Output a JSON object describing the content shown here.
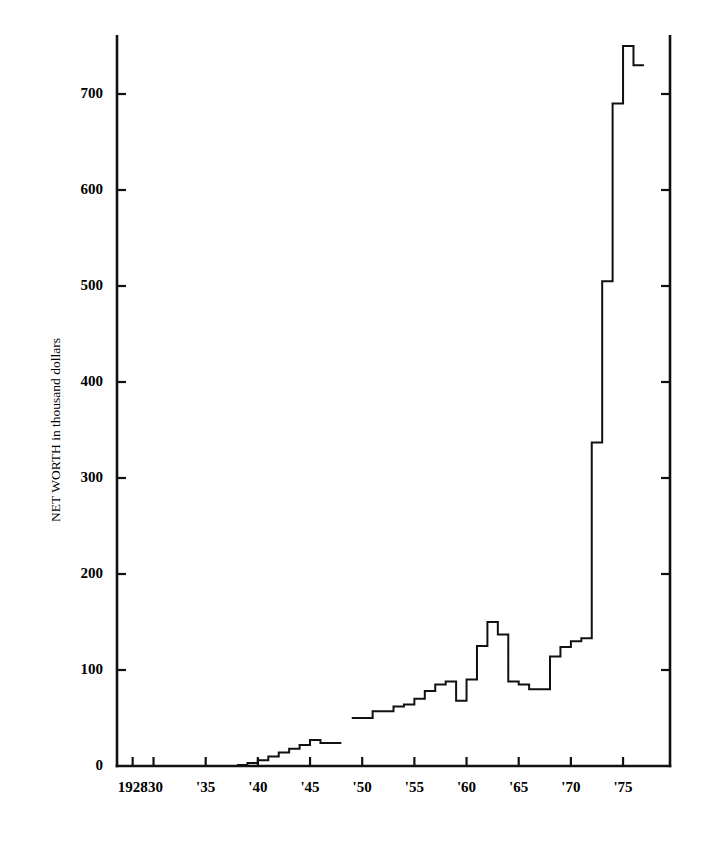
{
  "chart_data": {
    "type": "line",
    "title": "",
    "subtitle": "",
    "xlabel": "",
    "ylabel": "NET WORTH in thousand dollars",
    "ylim": [
      0,
      760
    ],
    "xlim": [
      1926.5,
      1979.5
    ],
    "grid": false,
    "legend": null,
    "annotations": [],
    "style": "step-post",
    "line_color": "#111111",
    "background_color": "#ffffff",
    "y_ticks": [
      0,
      100,
      200,
      300,
      400,
      500,
      600,
      700
    ],
    "y_tick_labels": [
      "0",
      "100",
      "200",
      "300",
      "400",
      "500",
      "600",
      "700"
    ],
    "x_ticks": [
      1928,
      1930,
      1935,
      1940,
      1945,
      1950,
      1955,
      1960,
      1965,
      1970,
      1975
    ],
    "x_tick_labels": [
      "1928",
      "'30",
      "'35",
      "'40",
      "'45",
      "'50",
      "'55",
      "'60",
      "'65",
      "'70",
      "'75"
    ],
    "x_minor_ticks": [
      1928,
      1930,
      1935,
      1940,
      1945,
      1950,
      1955,
      1960,
      1965,
      1970,
      1975
    ],
    "axis_spines": [
      "left",
      "bottom",
      "right"
    ],
    "segments": [
      {
        "name": "early-period",
        "x": [
          1938,
          1939,
          1940,
          1941,
          1942,
          1943,
          1944,
          1945,
          1946,
          1947
        ],
        "y": [
          1,
          3,
          6,
          10,
          14,
          18,
          22,
          27,
          24,
          24
        ]
      },
      {
        "name": "late-period",
        "x": [
          1949,
          1950,
          1951,
          1952,
          1953,
          1954,
          1955,
          1956,
          1957,
          1958,
          1959,
          1960,
          1961,
          1962,
          1963,
          1964,
          1965,
          1966,
          1967,
          1968,
          1969,
          1970,
          1971,
          1972,
          1973,
          1974,
          1975,
          1976
        ],
        "y": [
          50,
          50,
          57,
          57,
          62,
          64,
          70,
          78,
          85,
          88,
          68,
          90,
          125,
          150,
          137,
          88,
          85,
          80,
          80,
          114,
          124,
          130,
          133,
          337,
          505,
          690,
          750,
          730
        ]
      }
    ],
    "series": [
      {
        "name": "Net worth",
        "points": [
          {
            "year": 1938,
            "value": 1
          },
          {
            "year": 1939,
            "value": 3
          },
          {
            "year": 1940,
            "value": 6
          },
          {
            "year": 1941,
            "value": 10
          },
          {
            "year": 1942,
            "value": 14
          },
          {
            "year": 1943,
            "value": 18
          },
          {
            "year": 1944,
            "value": 22
          },
          {
            "year": 1945,
            "value": 27
          },
          {
            "year": 1946,
            "value": 24
          },
          {
            "year": 1947,
            "value": 24
          },
          {
            "year": 1949,
            "value": 50
          },
          {
            "year": 1950,
            "value": 50
          },
          {
            "year": 1951,
            "value": 57
          },
          {
            "year": 1952,
            "value": 57
          },
          {
            "year": 1953,
            "value": 62
          },
          {
            "year": 1954,
            "value": 64
          },
          {
            "year": 1955,
            "value": 70
          },
          {
            "year": 1956,
            "value": 78
          },
          {
            "year": 1957,
            "value": 85
          },
          {
            "year": 1958,
            "value": 88
          },
          {
            "year": 1959,
            "value": 68
          },
          {
            "year": 1960,
            "value": 90
          },
          {
            "year": 1961,
            "value": 125
          },
          {
            "year": 1962,
            "value": 150
          },
          {
            "year": 1963,
            "value": 137
          },
          {
            "year": 1964,
            "value": 88
          },
          {
            "year": 1965,
            "value": 85
          },
          {
            "year": 1966,
            "value": 80
          },
          {
            "year": 1967,
            "value": 80
          },
          {
            "year": 1968,
            "value": 114
          },
          {
            "year": 1969,
            "value": 124
          },
          {
            "year": 1970,
            "value": 130
          },
          {
            "year": 1971,
            "value": 133
          },
          {
            "year": 1972,
            "value": 337
          },
          {
            "year": 1973,
            "value": 505
          },
          {
            "year": 1974,
            "value": 690
          },
          {
            "year": 1975,
            "value": 750
          },
          {
            "year": 1976,
            "value": 730
          }
        ]
      }
    ]
  }
}
